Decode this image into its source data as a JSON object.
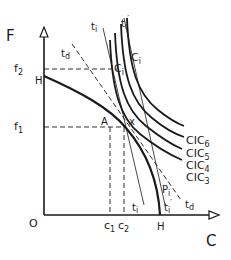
{
  "diagram": {
    "axes": {
      "y_label": "F",
      "x_label": "C",
      "origin_label": "O"
    },
    "y_ticks": [
      {
        "label": "f",
        "sub": "2",
        "id": "f2"
      },
      {
        "label": "H",
        "id": "H_y"
      },
      {
        "label": "f",
        "sub": "1",
        "id": "f1"
      }
    ],
    "x_ticks": [
      {
        "label": "c",
        "sub": "1",
        "id": "c1"
      },
      {
        "label": "c",
        "sub": "2",
        "id": "c2"
      },
      {
        "label": "H",
        "id": "H_x"
      }
    ],
    "points": {
      "A": "A",
      "x": "x",
      "P": "P",
      "P_sub": "i",
      "C": "C",
      "C_sub": "i",
      "C_prime": "C",
      "C_prime_sub": "i",
      "C_prime_mark": "′"
    },
    "lines": {
      "t_d": {
        "label": "t",
        "sub": "d"
      },
      "t_i": {
        "label": "t",
        "sub": "i"
      },
      "t_i_prime": {
        "label": "t",
        "sub": "i",
        "mark": "′"
      }
    },
    "curves": [
      {
        "label": "CIC",
        "sub": "6"
      },
      {
        "label": "CIC",
        "sub": "5"
      },
      {
        "label": "CIC",
        "sub": "4"
      },
      {
        "label": "CIC",
        "sub": "3"
      }
    ],
    "colors": {
      "ink": "#1a1a1a",
      "background": "#ffffff"
    }
  }
}
